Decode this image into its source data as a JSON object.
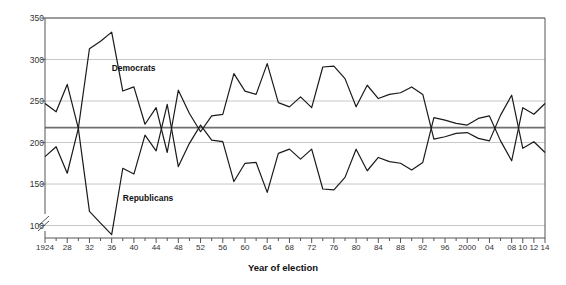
{
  "chart_data": {
    "type": "line",
    "title": "",
    "xlabel": "Year of election",
    "ylabel": "House of Representatives",
    "ylim": [
      85,
      350
    ],
    "y_ticks": [
      100,
      150,
      200,
      250,
      300,
      350
    ],
    "y_axis_break": true,
    "grid": true,
    "legend_position": "inline-annotations",
    "majority_line": 218,
    "x": [
      1924,
      1926,
      1928,
      1930,
      1932,
      1934,
      1936,
      1938,
      1940,
      1942,
      1944,
      1946,
      1948,
      1950,
      1952,
      1954,
      1956,
      1958,
      1960,
      1962,
      1964,
      1966,
      1968,
      1970,
      1972,
      1974,
      1976,
      1978,
      1980,
      1982,
      1984,
      1986,
      1988,
      1990,
      1992,
      1994,
      1996,
      1998,
      2000,
      2002,
      2004,
      2006,
      2008,
      2010,
      2012,
      2014
    ],
    "x_tick_labels": [
      "1924",
      "28",
      "32",
      "36",
      "40",
      "44",
      "48",
      "52",
      "56",
      "60",
      "64",
      "68",
      "72",
      "76",
      "80",
      "84",
      "88",
      "92",
      "96",
      "2000",
      "04",
      "08",
      "10",
      "12",
      "14"
    ],
    "x_tick_values": [
      1924,
      1928,
      1932,
      1936,
      1940,
      1944,
      1948,
      1952,
      1956,
      1960,
      1964,
      1968,
      1972,
      1976,
      1980,
      1984,
      1988,
      1992,
      1996,
      2000,
      2004,
      2008,
      2010,
      2012,
      2014
    ],
    "series": [
      {
        "name": "Democrats",
        "color": "#1a1a1a",
        "label_x": 1936,
        "label_y": 290,
        "values": [
          183,
          195,
          163,
          217,
          313,
          322,
          333,
          262,
          267,
          222,
          242,
          188,
          263,
          235,
          213,
          232,
          234,
          283,
          262,
          258,
          295,
          248,
          243,
          255,
          242,
          291,
          292,
          277,
          243,
          269,
          253,
          258,
          260,
          267,
          258,
          204,
          207,
          211,
          212,
          205,
          202,
          233,
          257,
          193,
          201,
          188
        ]
      },
      {
        "name": "Republicans",
        "color": "#1a1a1a",
        "label_x": 1938,
        "label_y": 133,
        "values": [
          247,
          237,
          270,
          217,
          117,
          103,
          89,
          169,
          162,
          209,
          190,
          246,
          171,
          199,
          221,
          203,
          201,
          153,
          175,
          176,
          140,
          187,
          192,
          180,
          192,
          144,
          143,
          158,
          192,
          166,
          182,
          177,
          175,
          167,
          176,
          230,
          227,
          223,
          221,
          229,
          232,
          202,
          178,
          242,
          234,
          247
        ]
      }
    ]
  },
  "annotations": {
    "democrats_label": "Democrats",
    "republicans_label": "Republicans"
  }
}
